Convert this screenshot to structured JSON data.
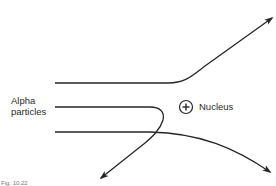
{
  "diagram": {
    "labels": {
      "alpha_line1": "Alpha",
      "alpha_line2": "particles",
      "nucleus": "Nucleus",
      "nucleus_symbol": "+",
      "caption": "Fig. 10.22"
    },
    "colors": {
      "stroke": "#262626",
      "background": "#ffffff"
    },
    "paths": [
      {
        "id": "deflected-up",
        "description": "Alpha particle passing above nucleus, deflected upward"
      },
      {
        "id": "backscattered",
        "description": "Alpha particle approaching nucleus head-on, reflected back"
      },
      {
        "id": "deflected-down",
        "description": "Alpha particle passing below nucleus, deflected downward"
      }
    ]
  }
}
